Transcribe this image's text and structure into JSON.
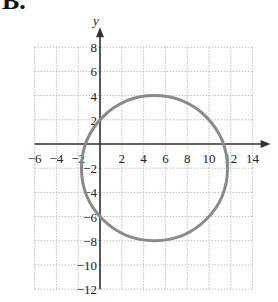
{
  "label": "B.",
  "chart_data": {
    "type": "line",
    "title": "",
    "xlabel": "",
    "ylabel": "y",
    "xlim": [
      -6,
      14
    ],
    "ylim": [
      -12,
      8
    ],
    "grid": true,
    "x_ticks": [
      -6,
      -4,
      -2,
      2,
      4,
      6,
      8,
      10,
      12,
      14
    ],
    "y_ticks": [
      8,
      6,
      4,
      2,
      -2,
      -4,
      -6,
      -8,
      -10,
      -12
    ],
    "series": [
      {
        "name": "ellipse",
        "shape": "ellipse",
        "center": [
          5,
          -2
        ],
        "rx": 6.7,
        "ry": 6,
        "color": "#8a8a8a"
      }
    ],
    "annotations": []
  }
}
